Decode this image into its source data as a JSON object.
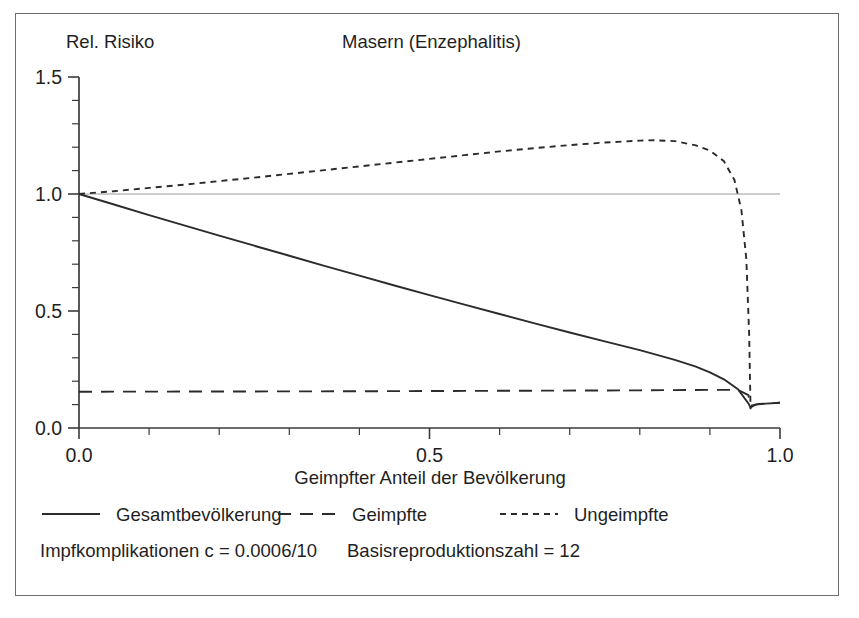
{
  "figure": {
    "title": "Masern (Enzephalitis)",
    "y_axis_caption": "Rel. Risiko",
    "x_axis_caption": "Geimpfter Anteil der Bevölkerung",
    "border_color": "#6e6e72",
    "background_color": "#ffffff",
    "ink_color": "#2b2b2b",
    "reference_line_color": "#9a9a9a"
  },
  "notes": [
    "Impfkomplikationen c = 0.0006/10",
    "Basisreproduktionszahl = 12"
  ],
  "legend": {
    "position": "below-axes",
    "entries": [
      {
        "label": "Gesamtbevölkerung",
        "style": "solid",
        "name": "legend-item-gesamtbevoelkerung"
      },
      {
        "label": "Geimpfte",
        "style": "dashed",
        "name": "legend-item-geimpfte"
      },
      {
        "label": "Ungeimpfte",
        "style": "dotted",
        "name": "legend-item-ungeimpfte"
      }
    ]
  },
  "chart_data": {
    "type": "line",
    "title": "Masern (Enzephalitis)",
    "xlabel": "Geimpfter Anteil der Bevölkerung",
    "ylabel": "Rel. Risiko",
    "xlim": [
      0.0,
      1.0
    ],
    "ylim": [
      0.0,
      1.5
    ],
    "xticks": [
      0.0,
      0.5,
      1.0
    ],
    "xtick_labels": [
      "0.0",
      "0.5",
      "1.0"
    ],
    "xminor_step": 0.1,
    "yticks": [
      0.0,
      0.5,
      1.0,
      1.5
    ],
    "ytick_labels": [
      "0.0",
      "0.5",
      "1.0",
      "1.5"
    ],
    "yminor_step": 0.1,
    "grid": false,
    "annotations": [
      {
        "text": "Impfkomplikationen c = 0.0006/10"
      },
      {
        "text": "Basisreproduktionszahl = 12"
      }
    ],
    "reference_lines": [
      {
        "orientation": "horizontal",
        "y": 1.0,
        "color": "#9a9a9a"
      }
    ],
    "series": [
      {
        "name": "Gesamtbevölkerung",
        "style": "solid",
        "x": [
          0.0,
          0.05,
          0.1,
          0.15,
          0.2,
          0.25,
          0.3,
          0.35,
          0.4,
          0.45,
          0.5,
          0.55,
          0.6,
          0.65,
          0.7,
          0.75,
          0.8,
          0.85,
          0.88,
          0.9,
          0.92,
          0.94,
          0.955,
          0.958,
          0.965,
          0.98,
          1.0
        ],
        "values": [
          1.0,
          0.955,
          0.91,
          0.866,
          0.822,
          0.779,
          0.736,
          0.693,
          0.651,
          0.609,
          0.568,
          0.527,
          0.487,
          0.447,
          0.408,
          0.37,
          0.333,
          0.291,
          0.262,
          0.238,
          0.208,
          0.166,
          0.105,
          0.088,
          0.1,
          0.104,
          0.108
        ]
      },
      {
        "name": "Geimpfte",
        "style": "dashed",
        "x": [
          0.0,
          0.2,
          0.4,
          0.6,
          0.8,
          0.9,
          0.94,
          0.955,
          0.958,
          0.97,
          1.0
        ],
        "values": [
          0.155,
          0.156,
          0.157,
          0.159,
          0.161,
          0.163,
          0.163,
          0.14,
          0.095,
          0.103,
          0.108
        ]
      },
      {
        "name": "Ungeimpfte",
        "style": "dotted",
        "x": [
          0.0,
          0.05,
          0.1,
          0.15,
          0.2,
          0.25,
          0.3,
          0.35,
          0.4,
          0.45,
          0.5,
          0.55,
          0.6,
          0.65,
          0.7,
          0.75,
          0.8,
          0.82,
          0.85,
          0.88,
          0.9,
          0.92,
          0.935,
          0.945,
          0.952,
          0.956,
          0.958
        ],
        "values": [
          1.0,
          1.012,
          1.026,
          1.04,
          1.055,
          1.07,
          1.086,
          1.102,
          1.118,
          1.134,
          1.15,
          1.166,
          1.182,
          1.196,
          1.209,
          1.22,
          1.228,
          1.23,
          1.226,
          1.208,
          1.186,
          1.14,
          1.06,
          0.93,
          0.72,
          0.4,
          0.08
        ]
      }
    ]
  }
}
